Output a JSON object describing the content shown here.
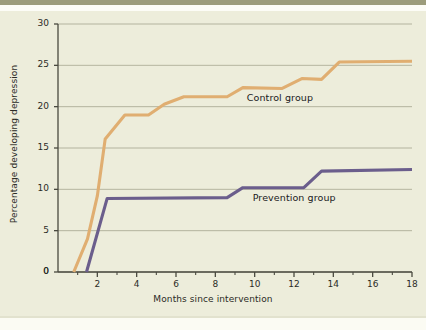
{
  "figure": {
    "background_color": "#EDEDDB",
    "page_background_color": "#EFEFDE"
  },
  "chart_data": {
    "type": "line",
    "title": "",
    "xlabel": "Months since intervention",
    "ylabel": "Percentage developing depression",
    "xlim": [
      0,
      18
    ],
    "ylim": [
      0,
      30
    ],
    "xticks": [
      0,
      2,
      4,
      6,
      8,
      10,
      12,
      14,
      16,
      18
    ],
    "xticklabels": [
      "0",
      "2",
      "4",
      "6",
      "8",
      "10",
      "12",
      "14",
      "16",
      "18"
    ],
    "x_minor_ticks": [
      1,
      3,
      5,
      7,
      9,
      11,
      13,
      15,
      17
    ],
    "yticks": [
      0,
      5,
      10,
      15,
      20,
      25,
      30
    ],
    "yticklabels": [
      "0",
      "5",
      "10",
      "15",
      "20",
      "25",
      "30"
    ],
    "grid": "horizontal",
    "grid_color": "#9A9A84",
    "legend_position": "inline-annotation",
    "series": [
      {
        "name": "Control group",
        "color": "#E0AE71",
        "label_x": 9.6,
        "label_y": 21.1,
        "points": [
          [
            0.8,
            0.0
          ],
          [
            1.5,
            4.0
          ],
          [
            2.0,
            9.2
          ],
          [
            2.4,
            16.1
          ],
          [
            3.4,
            19.0
          ],
          [
            4.6,
            19.0
          ],
          [
            5.4,
            20.3
          ],
          [
            6.4,
            21.2
          ],
          [
            8.6,
            21.2
          ],
          [
            9.4,
            22.3
          ],
          [
            11.4,
            22.2
          ],
          [
            12.4,
            23.4
          ],
          [
            13.4,
            23.3
          ],
          [
            14.3,
            25.4
          ],
          [
            18.0,
            25.5
          ]
        ]
      },
      {
        "name": "Prevention group",
        "color": "#6B5E8C",
        "label_x": 9.9,
        "label_y": 9.0,
        "points": [
          [
            1.45,
            0.0
          ],
          [
            2.5,
            8.9
          ],
          [
            8.6,
            9.0
          ],
          [
            9.4,
            10.2
          ],
          [
            12.5,
            10.2
          ],
          [
            13.4,
            12.2
          ],
          [
            18.0,
            12.4
          ]
        ]
      }
    ]
  }
}
